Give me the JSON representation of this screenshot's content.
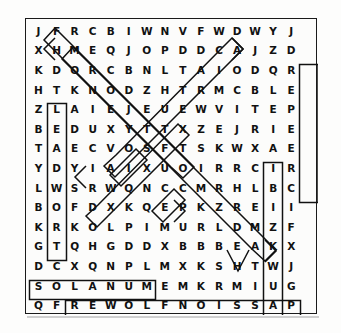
{
  "puzzle": {
    "type": "word-search",
    "rows": 15,
    "cols": 16,
    "grid": [
      [
        "J",
        "F",
        "R",
        "C",
        "B",
        "I",
        "W",
        "N",
        "V",
        "F",
        "W",
        "D",
        "W",
        "Y",
        "J",
        ""
      ],
      [
        "X",
        "H",
        "M",
        "E",
        "Q",
        "J",
        "O",
        "P",
        "D",
        "D",
        "C",
        "A",
        "J",
        "Z",
        "D",
        ""
      ],
      [
        "K",
        "D",
        "O",
        "R",
        "C",
        "B",
        "N",
        "L",
        "T",
        "A",
        "I",
        "O",
        "D",
        "Q",
        "R",
        ""
      ],
      [
        "H",
        "T",
        "K",
        "N",
        "O",
        "D",
        "Z",
        "H",
        "T",
        "R",
        "M",
        "C",
        "B",
        "L",
        "E",
        ""
      ],
      [
        "Z",
        "L",
        "A",
        "I",
        "E",
        "J",
        "E",
        "U",
        "E",
        "W",
        "V",
        "I",
        "T",
        "E",
        "P",
        ""
      ],
      [
        "B",
        "E",
        "D",
        "U",
        "X",
        "Y",
        "T",
        "T",
        "X",
        "Z",
        "E",
        "J",
        "R",
        "I",
        "E",
        ""
      ],
      [
        "T",
        "A",
        "E",
        "C",
        "V",
        "O",
        "S",
        "F",
        "T",
        "S",
        "K",
        "W",
        "X",
        "A",
        "E",
        ""
      ],
      [
        "Y",
        "D",
        "Y",
        "I",
        "A",
        "I",
        "X",
        "U",
        "O",
        "I",
        "R",
        "R",
        "C",
        "I",
        "R",
        ""
      ],
      [
        "L",
        "W",
        "S",
        "R",
        "W",
        "Q",
        "N",
        "C",
        "C",
        "M",
        "R",
        "H",
        "L",
        "B",
        "C",
        ""
      ],
      [
        "B",
        "O",
        "F",
        "D",
        "X",
        "K",
        "Q",
        "E",
        "P",
        "K",
        "Z",
        "R",
        "E",
        "I",
        "I",
        ""
      ],
      [
        "K",
        "R",
        "K",
        "O",
        "L",
        "P",
        "I",
        "M",
        "U",
        "R",
        "L",
        "D",
        "M",
        "Z",
        "F",
        ""
      ],
      [
        "G",
        "T",
        "Q",
        "H",
        "G",
        "D",
        "D",
        "X",
        "B",
        "B",
        "B",
        "E",
        "A",
        "K",
        "X",
        ""
      ],
      [
        "D",
        "C",
        "X",
        "Q",
        "N",
        "P",
        "L",
        "M",
        "X",
        "K",
        "S",
        "H",
        "T",
        "W",
        "J",
        ""
      ],
      [
        "S",
        "O",
        "L",
        "A",
        "N",
        "U",
        "M",
        "E",
        "M",
        "K",
        "R",
        "M",
        "I",
        "U",
        "G",
        ""
      ],
      [
        "Q",
        "F",
        "R",
        "E",
        "W",
        "O",
        "L",
        "F",
        "N",
        "O",
        "I",
        "S",
        "S",
        "A",
        "P",
        ""
      ]
    ],
    "found_words": [
      {
        "word": "LEADWORT",
        "orientation": "vertical",
        "start_row": 5,
        "start_col": 2
      },
      {
        "word": "CLEMATIS",
        "orientation": "vertical",
        "start_row": 8,
        "start_col": 14
      },
      {
        "word": "CREEPER",
        "orientation": "vertical-reversed",
        "start_row": 3,
        "start_col": 16
      },
      {
        "word": "SOLANUM",
        "orientation": "horizontal",
        "start_row": 14,
        "start_col": 1
      },
      {
        "word": "PASSIONFLOWER",
        "orientation": "horizontal-reversed",
        "start_row": 15,
        "start_col": 3
      }
    ],
    "accent_color": "#111111",
    "paper_color": "#fcfcfb"
  }
}
